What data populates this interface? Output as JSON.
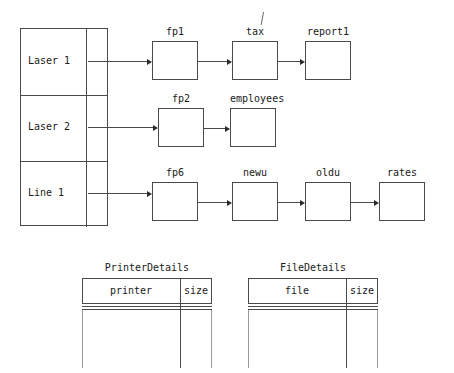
{
  "diagram": {
    "type": "linked-list-chain",
    "stroke_color": "#4a4a4a",
    "text_color": "#1a1a1a",
    "background": "#ffffff"
  },
  "index_table": {
    "name": "printer-index-table",
    "x": 20,
    "y": 28,
    "width": 88,
    "height": 198,
    "divider_x": 86,
    "rows": [
      {
        "label": "Laser 1",
        "chain": 0
      },
      {
        "label": "Laser 2",
        "chain": 1
      },
      {
        "label": "Line 1",
        "chain": 2
      }
    ]
  },
  "chains": [
    {
      "name": "laser1-chain",
      "source_row": "Laser 1",
      "y": 41,
      "nodes": [
        {
          "label": "fp1",
          "x": 152,
          "width": 46,
          "height": 39
        },
        {
          "label": "tax",
          "x": 232,
          "width": 46,
          "height": 39
        },
        {
          "label": "report1",
          "x": 305,
          "width": 46,
          "height": 39
        }
      ]
    },
    {
      "name": "laser2-chain",
      "source_row": "Laser 2",
      "y": 108,
      "nodes": [
        {
          "label": "fp2",
          "x": 158,
          "width": 46,
          "height": 39
        },
        {
          "label": "employees",
          "x": 230,
          "width": 46,
          "height": 39
        }
      ]
    },
    {
      "name": "line1-chain",
      "source_row": "Line 1",
      "y": 182,
      "nodes": [
        {
          "label": "fp6",
          "x": 152,
          "width": 46,
          "height": 39
        },
        {
          "label": "newu",
          "x": 232,
          "width": 46,
          "height": 39
        },
        {
          "label": "oldu",
          "x": 305,
          "width": 46,
          "height": 39
        },
        {
          "label": "rates",
          "x": 379,
          "width": 46,
          "height": 39
        }
      ]
    }
  ],
  "relation_tables": [
    {
      "name": "printer-details-table",
      "title": "PrinterDetails",
      "x": 82,
      "y": 278,
      "width": 130,
      "header_height": 26,
      "body_height": 64,
      "split_x": 98,
      "columns": [
        {
          "label": "printer"
        },
        {
          "label": "size"
        }
      ]
    },
    {
      "name": "file-details-table",
      "title": "FileDetails",
      "x": 248,
      "y": 278,
      "width": 130,
      "header_height": 26,
      "body_height": 64,
      "split_x": 98,
      "columns": [
        {
          "label": "file"
        },
        {
          "label": "size"
        }
      ]
    }
  ],
  "artifacts": [
    {
      "name": "scan-mark-over-tax",
      "x": 263,
      "y": 12,
      "height": 13
    }
  ]
}
